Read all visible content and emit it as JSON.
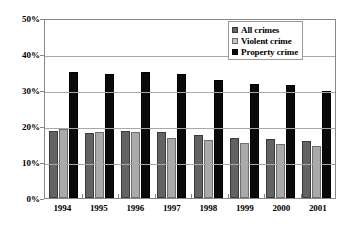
{
  "chart_data": {
    "type": "bar",
    "title": "",
    "xlabel": "",
    "ylabel": "",
    "categories": [
      "1994",
      "1995",
      "1996",
      "1997",
      "1998",
      "1999",
      "2000",
      "2001"
    ],
    "series": [
      {
        "name": "All crimes",
        "color": "#636363",
        "values": [
          18.5,
          18.0,
          18.6,
          18.3,
          17.4,
          16.7,
          16.3,
          15.9
        ]
      },
      {
        "name": "Violent crime",
        "color": "#c4c4c4",
        "values": [
          19.2,
          18.3,
          18.2,
          16.8,
          16.0,
          15.4,
          15.0,
          14.5
        ]
      },
      {
        "name": "Property crime",
        "color": "#0a0a0a",
        "values": [
          35.1,
          34.4,
          35.0,
          34.5,
          32.7,
          31.8,
          31.5,
          29.8
        ]
      }
    ],
    "ylim": [
      0,
      50
    ],
    "ytick_values": [
      0,
      10,
      20,
      30,
      40,
      50
    ],
    "ytick_labels": [
      "0%",
      "10%",
      "20%",
      "30%",
      "40%",
      "50%"
    ],
    "grid": true,
    "legend_position": "top-right"
  },
  "legend": {
    "items": [
      {
        "label": "All crimes"
      },
      {
        "label": "Violent crime"
      },
      {
        "label": "Property crime"
      }
    ]
  }
}
